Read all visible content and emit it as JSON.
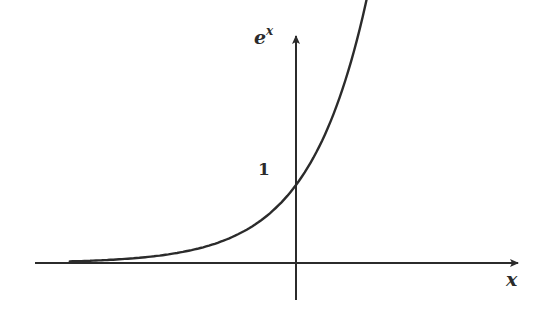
{
  "chart_data": {
    "type": "line",
    "title": "",
    "xlabel": "x",
    "ylabel": "e^x",
    "ylabel_base": "e",
    "ylabel_exp": "x",
    "y_tick_labels": [
      "1"
    ],
    "series": [
      {
        "name": "e^x",
        "function": "exp(x)",
        "x": [
          -4.0,
          -3.0,
          -2.0,
          -1.0,
          0.0,
          0.5,
          1.0,
          1.3
        ],
        "values": [
          0.018,
          0.05,
          0.135,
          0.368,
          1.0,
          1.649,
          2.718,
          3.669
        ]
      }
    ],
    "xlim": [
      -4.6,
      3.3
    ],
    "ylim": [
      -0.45,
      4.0
    ],
    "grid": false,
    "legend": "none",
    "annotations": [
      "1 marked on y-axis where curve crosses"
    ],
    "colors": {
      "axis": "#2b2b2b",
      "curve": "#2b2b2b",
      "background": "#ffffff"
    }
  }
}
